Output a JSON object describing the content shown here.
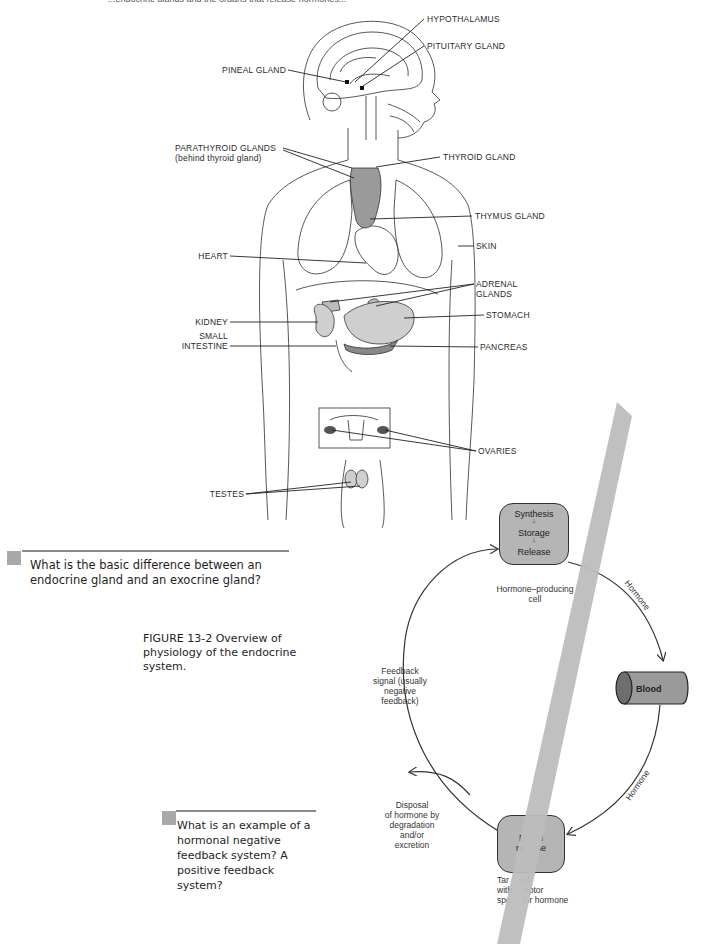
{
  "figure_13_1": {
    "top_cut_text": "...endocrine glands and the organs that release hormones...",
    "labels": {
      "hypothalamus": "HYPOTHALAMUS",
      "pituitary": "PITUITARY GLAND",
      "pineal": "PINEAL GLAND",
      "parathyroid": "PARATHYROID GLANDS",
      "parathyroid_note": "(behind thyroid gland)",
      "thyroid": "THYROID GLAND",
      "thymus": "THYMUS GLAND",
      "skin": "SKIN",
      "heart": "HEART",
      "adrenal_1": "ADRENAL",
      "adrenal_2": "GLANDS",
      "kidney": "KIDNEY",
      "stomach": "STOMACH",
      "small_intestine_1": "SMALL",
      "small_intestine_2": "INTESTINE",
      "pancreas": "PANCREAS",
      "ovaries": "OVARIES",
      "testes": "TESTES"
    }
  },
  "questions": [
    {
      "text": "What is the basic difference between an endocrine gland and an exocrine gland?"
    },
    {
      "text": "What is an example of a hormonal negative feedback system? A positive feedback system?"
    }
  ],
  "figure_13_2": {
    "caption_label": "FIGURE 13-2",
    "caption_text": "Overview of physiology of the endocrine system.",
    "producing_cell": {
      "steps": [
        "Synthesis",
        "Storage",
        "Release"
      ],
      "arrow": "↓",
      "label_1": "Hormone–producing",
      "label_2": "cell"
    },
    "hormone_label_top": "Hormone",
    "hormone_label_bottom": "Hormone",
    "blood": "Blood",
    "feedback": [
      "Feedback",
      "signal (usually",
      "negative",
      "feedback)"
    ],
    "disposal": [
      "Disposal",
      "of hormone by",
      "degradation",
      "and/or",
      "excretion"
    ],
    "target_cell": {
      "inner_1": "D     d",
      "inner_2": "re     se",
      "label_1": "Tar     ell",
      "label_2": "with     eptor",
      "label_3": "spe     for hormone"
    }
  },
  "colors": {
    "cell_fill": "#b5b5b5",
    "overlay_strip": "#bdbdbd",
    "rule": "#8a8a8a",
    "question_marker": "#a9a9a9"
  }
}
